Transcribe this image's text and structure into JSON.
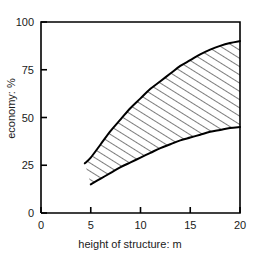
{
  "chart_data": {
    "type": "area",
    "title": "",
    "subtitle": "",
    "xlabel": "height of structure: m",
    "ylabel": "economy: %",
    "xlim": [
      0,
      20
    ],
    "ylim": [
      0,
      100
    ],
    "xticks": [
      "0",
      "5",
      "10",
      "15",
      "20"
    ],
    "xtick_values": [
      0,
      5,
      10,
      15,
      20
    ],
    "yticks": [
      "0",
      "25",
      "50",
      "75",
      "100"
    ],
    "ytick_values": [
      0,
      25,
      50,
      75,
      100
    ],
    "grid": false,
    "legend": null,
    "annotations": [],
    "band_fill": "hatched-diagonal",
    "line_color": "#000000",
    "series": [
      {
        "name": "upper bound",
        "x": [
          4.4,
          5,
          6,
          7,
          8,
          9,
          10,
          11,
          12,
          13,
          14,
          15,
          16,
          17,
          18,
          19,
          20
        ],
        "values": [
          26,
          29,
          36,
          43,
          49,
          55,
          60,
          65,
          69,
          73,
          77,
          80,
          83,
          85.5,
          87.5,
          89,
          90
        ]
      },
      {
        "name": "lower bound",
        "x": [
          5,
          6,
          7,
          8,
          9,
          10,
          11,
          12,
          13,
          14,
          15,
          16,
          17,
          18,
          19,
          20
        ],
        "values": [
          15,
          18,
          21,
          24,
          26.5,
          29,
          31.5,
          34,
          36,
          38,
          39.5,
          41,
          42.5,
          43.5,
          44.5,
          45
        ]
      }
    ]
  },
  "axes": {
    "x_title": "height of structure: m",
    "y_title": "economy: %"
  }
}
